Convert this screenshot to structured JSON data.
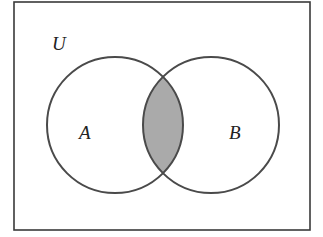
{
  "diagram": {
    "type": "venn",
    "universe_label": "U",
    "sets": [
      {
        "label": "A"
      },
      {
        "label": "B"
      }
    ],
    "shaded_region": "A ∩ B",
    "colors": {
      "outline": "#4a4a4a",
      "shade": "#aaaaaa",
      "background": "#ffffff"
    }
  }
}
